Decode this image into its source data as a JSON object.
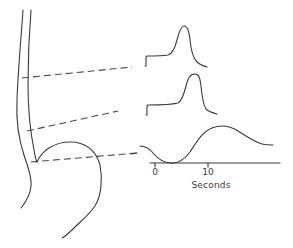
{
  "figure": {
    "colors": {
      "line": "#3a3a3a",
      "background": "#ffffff"
    }
  },
  "traces": [
    {
      "name": "upper-esophagus-trace",
      "site": "upper"
    },
    {
      "name": "lower-esophagus-trace",
      "site": "lower"
    },
    {
      "name": "sphincter-trace",
      "site": "lower-esophageal-sphincter"
    }
  ],
  "axis": {
    "ticks": [
      {
        "value": "0"
      },
      {
        "value": "10"
      }
    ],
    "title": "Seconds"
  }
}
